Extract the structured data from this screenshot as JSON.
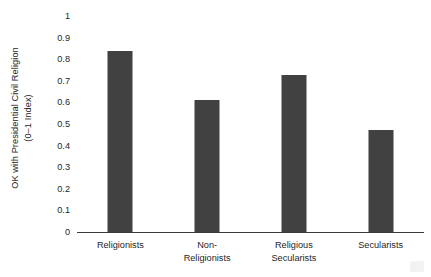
{
  "chart_data": {
    "type": "bar",
    "title": "",
    "subtitle": "",
    "categories": [
      "Religionists",
      "Non-Religionists",
      "Religious Secularists",
      "Secularists"
    ],
    "category_lines": [
      [
        "Religionists"
      ],
      [
        "Non-",
        "Religionists"
      ],
      [
        "Religious",
        "Secularists"
      ],
      [
        "Secularists"
      ]
    ],
    "values": [
      0.84,
      0.61,
      0.725,
      0.47
    ],
    "xlabel": "",
    "ylabel": "OK with Presidential Civil Religion (0–1 Index)",
    "ylabel_lines": [
      "OK with Presidential Civil Religion",
      "(0–1 Index)"
    ],
    "ylim": [
      0,
      1
    ],
    "ytick_values": [
      0,
      0.1,
      0.2,
      0.3,
      0.4,
      0.5,
      0.6,
      0.7,
      0.8,
      0.9,
      1
    ],
    "ytick_labels": [
      "0",
      "0.1",
      "0.2",
      "0.3",
      "0.4",
      "0.5",
      "0.6",
      "0.7",
      "0.8",
      "0.9",
      "1"
    ],
    "grid": false,
    "legend": false,
    "legend_position": "none",
    "bar_color": "#414141",
    "axis_color": "#3a3a3a",
    "background_color": "#ffffff"
  }
}
